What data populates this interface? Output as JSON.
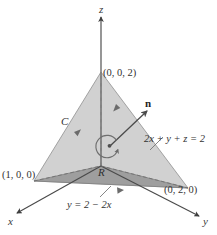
{
  "figure": {
    "type": "3d-geometry-diagram",
    "background_color": "#ffffff"
  },
  "axes": {
    "z_label": "z",
    "x_label": "x",
    "y_label": "y",
    "axis_color": "#4a4a4a"
  },
  "vertices": {
    "z_intercept": "(0, 0, 2)",
    "x_intercept": "(1, 0, 0)",
    "y_intercept": "(0, 2, 0)"
  },
  "annotations": {
    "curve_label": "C",
    "normal_label": "n",
    "plane_equation": "2x + y + z = 2",
    "region_label": "R",
    "boundary_line": "y = 2 − 2x"
  },
  "colors": {
    "plane_fill": "#cfcfcf",
    "region_fill": "#9d9d9d",
    "outline": "#6e6e6e",
    "dashed_line": "#8a8a8a",
    "arrow": "#595959",
    "text": "#2b2b2b"
  }
}
